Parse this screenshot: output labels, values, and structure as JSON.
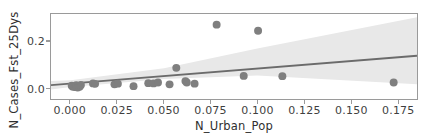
{
  "chart_data": {
    "type": "scatter",
    "title": "",
    "xlabel": "N_Urban_Pop",
    "ylabel": "N_Cases_Fst_25Dys",
    "xticks": [
      "0.000",
      "0.025",
      "0.050",
      "0.075",
      "0.100",
      "0.125",
      "0.150",
      "0.175"
    ],
    "xtick_values": [
      0.0,
      0.025,
      0.05,
      0.075,
      0.1,
      0.125,
      0.15,
      0.175
    ],
    "yticks": [
      "0.0",
      "0.2"
    ],
    "ytick_values": [
      0.0,
      0.2
    ],
    "xlim": [
      -0.0105,
      0.1855
    ],
    "ylim": [
      -0.047,
      0.318
    ],
    "grid": false,
    "legend": null,
    "marker_color": "#7f7f7f",
    "line_color": "#6b6b6b",
    "band_color": "#e8e8e8",
    "axis_color": "#9a9a9a",
    "text_color": "#3f3f3f",
    "points": [
      {
        "x": 0.0006,
        "y": 0.01
      },
      {
        "x": 0.0012,
        "y": 0.006
      },
      {
        "x": 0.0022,
        "y": 0.004
      },
      {
        "x": 0.003,
        "y": 0.012
      },
      {
        "x": 0.0038,
        "y": 0.002
      },
      {
        "x": 0.0048,
        "y": 0.006
      },
      {
        "x": 0.0055,
        "y": 0.013
      },
      {
        "x": 0.012,
        "y": 0.02
      },
      {
        "x": 0.0131,
        "y": 0.018
      },
      {
        "x": 0.0235,
        "y": 0.016
      },
      {
        "x": 0.0253,
        "y": 0.019
      },
      {
        "x": 0.0337,
        "y": 0.008
      },
      {
        "x": 0.0416,
        "y": 0.021
      },
      {
        "x": 0.0444,
        "y": 0.02
      },
      {
        "x": 0.0468,
        "y": 0.024
      },
      {
        "x": 0.053,
        "y": 0.016
      },
      {
        "x": 0.0566,
        "y": 0.087
      },
      {
        "x": 0.0615,
        "y": 0.03
      },
      {
        "x": 0.0622,
        "y": 0.024
      },
      {
        "x": 0.0664,
        "y": 0.019
      },
      {
        "x": 0.0782,
        "y": 0.272
      },
      {
        "x": 0.0927,
        "y": 0.052
      },
      {
        "x": 0.1004,
        "y": 0.246
      },
      {
        "x": 0.1134,
        "y": 0.051
      },
      {
        "x": 0.173,
        "y": 0.024
      }
    ],
    "regression_line": {
      "name": "linear fit",
      "x": [
        -0.0105,
        0.1855
      ],
      "y": [
        0.0123,
        0.1385
      ],
      "slope": 0.644,
      "intercept": 0.0191
    },
    "confidence_band": {
      "name": "95% confidence interval",
      "x": [
        -0.0105,
        0.0,
        0.05,
        0.1,
        0.1855
      ],
      "upper": [
        0.0305,
        0.033,
        0.0855,
        0.17,
        0.304
      ],
      "lower": [
        -0.006,
        0.005,
        0.0385,
        0.0535,
        0.0165
      ]
    }
  }
}
